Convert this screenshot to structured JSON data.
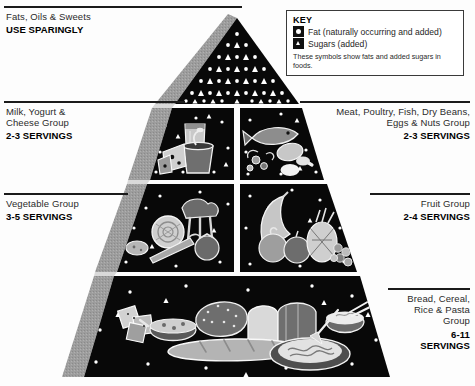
{
  "key": {
    "title": "KEY",
    "fat_label": "Fat (naturally occurring and added)",
    "sugar_label": "Sugars (added)",
    "note": "These symbols show fats and added sugars in foods.",
    "fat_symbol": "circle-icon",
    "sugar_symbol": "triangle-icon"
  },
  "groups": {
    "fats": {
      "name": "Fats, Oils & Sweets",
      "servings": "USE SPARINGLY"
    },
    "milk": {
      "name": "Milk, Yogurt &\nCheese Group",
      "servings": "2-3 SERVINGS"
    },
    "meat": {
      "name": "Meat, Poultry, Fish, Dry Beans,\nEggs & Nuts Group",
      "servings": "2-3 SERVINGS"
    },
    "vegetable": {
      "name": "Vegetable Group",
      "servings": "3-5 SERVINGS"
    },
    "fruit": {
      "name": "Fruit Group",
      "servings": "2-4 SERVINGS"
    },
    "bread": {
      "name": "Bread, Cereal,\nRice & Pasta\nGroup",
      "servings": "6-11\nSERVINGS"
    }
  },
  "colors": {
    "panel": "#080808",
    "shadow": "#9a9a9a",
    "shadow_dark": "#7d7d7d",
    "rule": "#1b1b1b",
    "paper": "#ffffff",
    "food_light": "#d8d8d8",
    "food_mid": "#a8a8a8",
    "food_dark": "#636363"
  },
  "tiers": [
    {
      "id": "apex",
      "label": "fats-oils-sweets-tier"
    },
    {
      "id": "tier2-left",
      "label": "milk-group-tier"
    },
    {
      "id": "tier2-right",
      "label": "meat-group-tier"
    },
    {
      "id": "tier3-left",
      "label": "vegetable-group-tier"
    },
    {
      "id": "tier3-right",
      "label": "fruit-group-tier"
    },
    {
      "id": "tier4",
      "label": "bread-group-tier"
    }
  ]
}
